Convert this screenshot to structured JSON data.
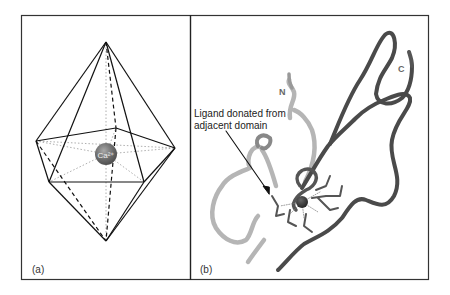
{
  "figure": {
    "panels": [
      {
        "id": "a",
        "label": "(a)",
        "description": "Pentagonal bipyramid coordination polyhedron around calcium ion",
        "ion_label": "Ca²⁺"
      },
      {
        "id": "b",
        "label": "(b)",
        "description": "Ribbon diagram of calcium-binding protein domain",
        "annotation_line1": "Ligand donated from",
        "annotation_line2": "adjacent domain",
        "n_terminus": "N",
        "c_terminus": "C"
      }
    ],
    "colors": {
      "frame": "#333333",
      "polyhedron_edge": "#111111",
      "dotted_bond": "#999999",
      "ion": "#6a6a6a",
      "ribbon_dark": "#4a4a4a",
      "ribbon_light": "#b5b5b5",
      "ribbon_mid": "#888888"
    }
  }
}
